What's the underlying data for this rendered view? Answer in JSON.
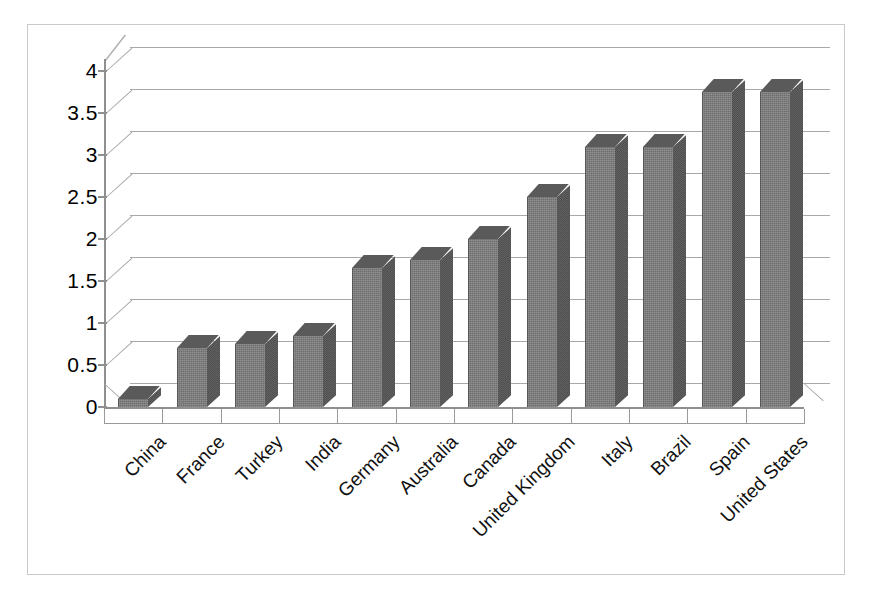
{
  "chart_data": {
    "type": "bar",
    "title": "",
    "subtitle": "",
    "xlabel": "",
    "ylabel": "",
    "ylim": [
      0,
      4
    ],
    "ytick_labels": [
      "4",
      "3.5",
      "3",
      "2.5",
      "2",
      "1.5",
      "1",
      "0.5",
      "0"
    ],
    "ytick_values": [
      4,
      3.5,
      3,
      2.5,
      2,
      1.5,
      1,
      0.5,
      0
    ],
    "grid": true,
    "legend": "none",
    "style": "3d-column",
    "categories": [
      "China",
      "France",
      "Turkey",
      "India",
      "Germany",
      "Australia",
      "Canada",
      "United Kingdom",
      "Italy",
      "Brazil",
      "Spain",
      "United States"
    ],
    "values": [
      0.1,
      0.7,
      0.75,
      0.85,
      1.65,
      1.75,
      2.0,
      2.5,
      3.1,
      3.1,
      3.75,
      3.75
    ],
    "series": [
      {
        "name": "Series 1",
        "values": [
          0.1,
          0.7,
          0.75,
          0.85,
          1.65,
          1.75,
          2.0,
          2.5,
          3.1,
          3.1,
          3.75,
          3.75
        ]
      }
    ],
    "colors": {
      "bar_front": "#6e6e6e",
      "bar_side": "#4f4f4f",
      "bar_top": "#5a5a5a",
      "gridline": "#a8a8a8",
      "axis": "#8f8f8f",
      "frame": "#c9c9c9",
      "background": "#ffffff",
      "text": "#111111"
    }
  }
}
